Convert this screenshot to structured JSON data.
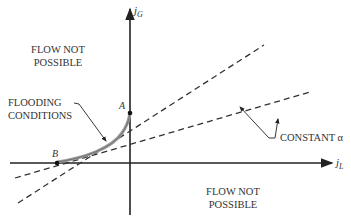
{
  "axes": {
    "y_label": "j",
    "y_sub": "G",
    "x_label": "j",
    "x_sub": "L"
  },
  "regions": {
    "upper_left": [
      "FLOW  NOT",
      "POSSIBLE"
    ],
    "lower_right": [
      "FLOW NOT",
      "POSSIBLE"
    ]
  },
  "annotations": {
    "flooding": [
      "FLOODING",
      "CONDITIONS"
    ],
    "constant_alpha": "CONSTANT α"
  },
  "points": {
    "a": "A",
    "b": "B"
  },
  "colors": {
    "axis": "#222222",
    "curve": "#999999",
    "dashed": "#333333"
  }
}
